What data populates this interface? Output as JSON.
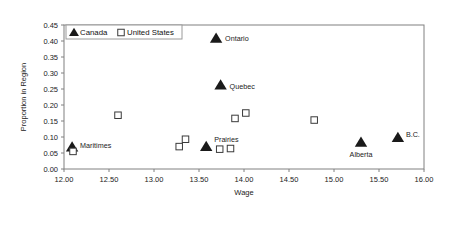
{
  "chart_data": {
    "type": "scatter",
    "title": "",
    "xlabel": "Wage",
    "ylabel": "Proportion in Region",
    "xlim": [
      12.0,
      16.0
    ],
    "ylim": [
      0.0,
      0.45
    ],
    "xticks": [
      "12.00",
      "12.50",
      "13.00",
      "13.50",
      "14.00",
      "14.50",
      "15.00",
      "15.50",
      "16.00"
    ],
    "xtick_values": [
      12.0,
      12.5,
      13.0,
      13.5,
      14.0,
      14.5,
      15.0,
      15.5,
      16.0
    ],
    "yticks": [
      "0.00",
      "0.05",
      "0.10",
      "0.15",
      "0.20",
      "0.25",
      "0.30",
      "0.35",
      "0.40",
      "0.45"
    ],
    "ytick_values": [
      0.0,
      0.05,
      0.1,
      0.15,
      0.2,
      0.25,
      0.3,
      0.35,
      0.4,
      0.45
    ],
    "grid": false,
    "legend_position": "top-left",
    "series": [
      {
        "name": "Canada",
        "marker": "triangle",
        "color": "#1a1a1a",
        "points": [
          {
            "label": "Maritimes",
            "x": 12.09,
            "y": 0.068,
            "label_dx": 8,
            "label_dy": 1
          },
          {
            "label": "Prairies",
            "x": 13.58,
            "y": 0.07,
            "label_dx": 8,
            "label_dy": -5
          },
          {
            "label": "Quebec",
            "x": 13.74,
            "y": 0.262,
            "label_dx": 9,
            "label_dy": 4
          },
          {
            "label": "Ontario",
            "x": 13.69,
            "y": 0.408,
            "label_dx": 9,
            "label_dy": 3
          },
          {
            "label": "Alberta",
            "x": 15.3,
            "y": 0.083,
            "label_dx": 0,
            "label_dy": 15
          },
          {
            "label": "B.C.",
            "x": 15.71,
            "y": 0.098,
            "label_dx": 8,
            "label_dy": -1
          }
        ]
      },
      {
        "name": "United States",
        "marker": "open-square",
        "color": "#3a3a3a",
        "points": [
          {
            "label": "",
            "x": 12.1,
            "y": 0.055
          },
          {
            "label": "",
            "x": 12.6,
            "y": 0.168
          },
          {
            "label": "",
            "x": 13.35,
            "y": 0.093
          },
          {
            "label": "",
            "x": 13.28,
            "y": 0.07
          },
          {
            "label": "",
            "x": 13.73,
            "y": 0.062
          },
          {
            "label": "",
            "x": 13.85,
            "y": 0.064
          },
          {
            "label": "",
            "x": 13.9,
            "y": 0.158
          },
          {
            "label": "",
            "x": 14.02,
            "y": 0.175
          },
          {
            "label": "",
            "x": 14.78,
            "y": 0.153
          }
        ]
      }
    ],
    "legend": [
      {
        "label": "Canada",
        "marker": "triangle"
      },
      {
        "label": "United States",
        "marker": "open-square"
      }
    ]
  }
}
